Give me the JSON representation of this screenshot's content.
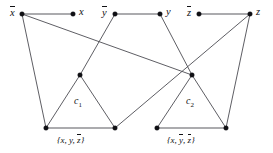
{
  "figure": {
    "type": "graph-diagram",
    "background_color": "#ffffff",
    "edge_color": "#4c4c52",
    "node_color": "#101014",
    "width": 273,
    "height": 153
  },
  "variable_nodes": [
    {
      "id": "not-x",
      "label": "x",
      "overline": true,
      "x": 22,
      "y": 14,
      "label_x": 10,
      "label_y": 6
    },
    {
      "id": "x",
      "label": "x",
      "overline": false,
      "x": 73,
      "y": 14,
      "label_x": 79,
      "label_y": 7
    },
    {
      "id": "not-y",
      "label": "y",
      "overline": true,
      "x": 115,
      "y": 14,
      "label_x": 102,
      "label_y": 6
    },
    {
      "id": "y",
      "label": "y",
      "overline": false,
      "x": 160,
      "y": 14,
      "label_x": 166,
      "label_y": 7
    },
    {
      "id": "not-z",
      "label": "z",
      "overline": true,
      "x": 199,
      "y": 14,
      "label_x": 187,
      "label_y": 6
    },
    {
      "id": "z",
      "label": "z",
      "overline": false,
      "x": 250,
      "y": 14,
      "label_x": 256,
      "label_y": 7
    }
  ],
  "clauses": [
    {
      "id": "c1",
      "name": "c",
      "subscript": "1",
      "name_x": 74,
      "name_y": 96,
      "literals": [
        {
          "text": "x",
          "overline": false
        },
        {
          "text": "y",
          "overline": false
        },
        {
          "text": "z",
          "overline": true
        }
      ],
      "set_label_x": 57,
      "set_label_y": 134,
      "apex": {
        "x": 80,
        "y": 75
      },
      "left": {
        "x": 46,
        "y": 128
      },
      "right": {
        "x": 115,
        "y": 128
      }
    },
    {
      "id": "c2",
      "name": "c",
      "subscript": "2",
      "name_x": 186,
      "name_y": 96,
      "literals": [
        {
          "text": "x",
          "overline": false
        },
        {
          "text": "y",
          "overline": true
        },
        {
          "text": "z",
          "overline": true
        }
      ],
      "set_label_x": 167,
      "set_label_y": 134,
      "apex": {
        "x": 192,
        "y": 75
      },
      "left": {
        "x": 157,
        "y": 128
      },
      "right": {
        "x": 226,
        "y": 128
      }
    }
  ],
  "variable_edges": [
    {
      "id": "edge-notx-x",
      "from": "not-x",
      "to": "x",
      "x1": 22,
      "y1": 14,
      "x2": 73,
      "y2": 14
    },
    {
      "id": "edge-noty-y",
      "from": "not-y",
      "to": "y",
      "x1": 115,
      "y1": 14,
      "x2": 160,
      "y2": 14
    },
    {
      "id": "edge-notz-z",
      "from": "not-z",
      "to": "z",
      "x1": 199,
      "y1": 14,
      "x2": 250,
      "y2": 14
    }
  ],
  "clause_edges": [
    {
      "id": "edge-c1-apex-left",
      "x1": 80,
      "y1": 75,
      "x2": 46,
      "y2": 128
    },
    {
      "id": "edge-c1-apex-right",
      "x1": 80,
      "y1": 75,
      "x2": 115,
      "y2": 128
    },
    {
      "id": "edge-c1-base",
      "x1": 46,
      "y1": 128,
      "x2": 115,
      "y2": 128
    },
    {
      "id": "edge-c2-apex-left",
      "x1": 192,
      "y1": 75,
      "x2": 157,
      "y2": 128
    },
    {
      "id": "edge-c2-apex-right",
      "x1": 192,
      "y1": 75,
      "x2": 226,
      "y2": 128
    },
    {
      "id": "edge-c2-base",
      "x1": 157,
      "y1": 128,
      "x2": 226,
      "y2": 128
    }
  ],
  "connector_edges": [
    {
      "id": "edge-notx-to-c1-left",
      "from": "not-x",
      "to": "c1-left",
      "x1": 22,
      "y1": 14,
      "x2": 46,
      "y2": 128
    },
    {
      "id": "edge-notx-to-c2-apex",
      "from": "not-x",
      "to": "c2-apex",
      "x1": 22,
      "y1": 14,
      "x2": 192,
      "y2": 75
    },
    {
      "id": "edge-noty-to-c1-apex",
      "from": "not-y",
      "to": "c1-apex",
      "x1": 115,
      "y1": 14,
      "x2": 80,
      "y2": 75
    },
    {
      "id": "edge-y-to-c2-apex",
      "from": "y",
      "to": "c2-apex",
      "x1": 160,
      "y1": 14,
      "x2": 192,
      "y2": 75
    },
    {
      "id": "edge-z-to-c1-right",
      "from": "z",
      "to": "c1-right",
      "x1": 250,
      "y1": 14,
      "x2": 115,
      "y2": 128
    },
    {
      "id": "edge-z-to-c2-right",
      "from": "z",
      "to": "c2-right",
      "x1": 250,
      "y1": 14,
      "x2": 226,
      "y2": 128
    }
  ],
  "apex_nodes": [
    {
      "id": "c1-apex",
      "x": 80,
      "y": 75
    },
    {
      "id": "c2-apex",
      "x": 192,
      "y": 75
    }
  ],
  "base_nodes": [
    {
      "id": "c1-left",
      "x": 46,
      "y": 128
    },
    {
      "id": "c1-right",
      "x": 115,
      "y": 128
    },
    {
      "id": "c2-left",
      "x": 157,
      "y": 128
    },
    {
      "id": "c2-right",
      "x": 226,
      "y": 128
    }
  ],
  "punctuation": {
    "open_brace": "{",
    "close_brace": "}",
    "comma": ","
  }
}
